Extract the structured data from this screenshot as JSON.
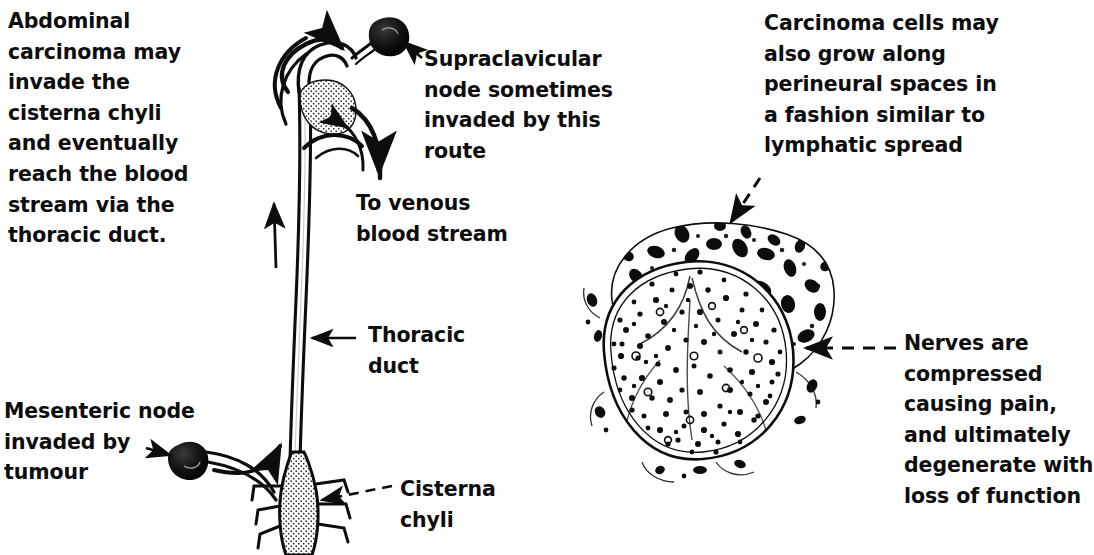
{
  "figure": {
    "background_color": "#ffffff",
    "ink_color": "#0d0d0d"
  },
  "labels": {
    "abdominal_carcinoma": {
      "text": "Abdominal\ncarcinoma may\ninvade the\ncisterna chyli\nand eventually\nreach the blood\nstream via the\nthoracic duct.",
      "x": 8,
      "y": 6
    },
    "supraclavicular_node": {
      "text": "Supraclavicular\nnode sometimes\ninvaded by this\nroute",
      "x": 424,
      "y": 44
    },
    "to_venous_blood_stream": {
      "text": "To venous\nblood stream",
      "x": 356,
      "y": 188
    },
    "thoracic_duct": {
      "text": "Thoracic\nduct",
      "x": 368,
      "y": 320
    },
    "mesenteric_node": {
      "text": "Mesenteric node\ninvaded by\ntumour",
      "x": 4,
      "y": 396
    },
    "cisterna_chyli": {
      "text": "Cisterna\nchyli",
      "x": 400,
      "y": 474
    },
    "carcinoma_perineural": {
      "text": "Carcinoma cells may\nalso grow along\nperineural spaces in\na fashion similar to\nlymphatic spread",
      "x": 764,
      "y": 8
    },
    "nerves_compressed": {
      "text": "Nerves are\ncompressed\ncausing pain,\nand ultimately\ndegenerate with\nloss of function",
      "x": 904,
      "y": 328
    }
  },
  "anatomy": {
    "thoracic_duct_name": "thoracic-duct",
    "cisterna_chyli_name": "cisterna-chyli",
    "supraclavicular_node_name": "supraclavicular-lymph-node",
    "mesenteric_node_name": "mesenteric-lymph-node",
    "nerve_section_name": "nerve-cross-section",
    "tumour_mass_name": "carcinoma-cell-mass"
  },
  "arrows": [
    {
      "name": "arrow-to-supraclavicular-node",
      "style": "dashed",
      "direction": "up-left"
    },
    {
      "name": "arrow-to-venous-blood-stream",
      "style": "solid",
      "direction": "down"
    },
    {
      "name": "arrow-flow-up-duct",
      "style": "solid",
      "direction": "up"
    },
    {
      "name": "arrow-thoracic-duct-label",
      "style": "solid",
      "direction": "left"
    },
    {
      "name": "arrow-to-mesenteric-node",
      "style": "dashed",
      "direction": "right"
    },
    {
      "name": "arrow-flow-into-cisterna",
      "style": "solid",
      "direction": "up"
    },
    {
      "name": "arrow-cisterna-chyli-label",
      "style": "dashed",
      "direction": "left"
    },
    {
      "name": "arrow-to-tumour-mass",
      "style": "dashed",
      "direction": "down-left"
    },
    {
      "name": "arrow-to-nerve-bundle",
      "style": "dashed",
      "direction": "left"
    }
  ]
}
